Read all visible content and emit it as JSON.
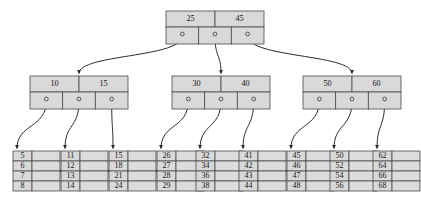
{
  "diagram": {
    "type": "b-plus-tree",
    "colors": {
      "node_fill": "#d9d9d9",
      "node_stroke": "#4a4a4a",
      "edge": "#2b2b2b",
      "text": "#161616",
      "background": "#ffffff"
    },
    "root": {
      "keys": [
        "25",
        "45"
      ],
      "pointer_count": 3
    },
    "internal_nodes": [
      {
        "keys": [
          "10",
          "15"
        ],
        "pointer_count": 3
      },
      {
        "keys": [
          "30",
          "40"
        ],
        "pointer_count": 3
      },
      {
        "keys": [
          "50",
          "60"
        ],
        "pointer_count": 3
      }
    ],
    "leaves": [
      {
        "values": [
          "5",
          "6",
          "7",
          "8"
        ]
      },
      {
        "values": [
          "11",
          "12",
          "13",
          "14"
        ]
      },
      {
        "values": [
          "15",
          "18",
          "21",
          "24"
        ]
      },
      {
        "values": [
          "26",
          "27",
          "28",
          "29"
        ]
      },
      {
        "values": [
          "32",
          "34",
          "36",
          "38"
        ]
      },
      {
        "values": [
          "41",
          "42",
          "43",
          "44"
        ]
      },
      {
        "values": [
          "45",
          "46",
          "47",
          "48"
        ]
      },
      {
        "values": [
          "50",
          "52",
          "54",
          "56"
        ]
      },
      {
        "values": [
          "62",
          "64",
          "66",
          "68"
        ]
      }
    ]
  }
}
